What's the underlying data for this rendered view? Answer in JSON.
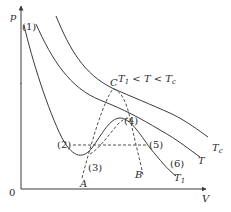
{
  "diagram": {
    "axes": {
      "y_label": "p",
      "x_label": "V",
      "origin_label": "0"
    },
    "condition": {
      "T1": "T",
      "sub1": "1",
      "lt1": " < ",
      "T": "T",
      "lt2": " < ",
      "Tc": "T",
      "subc": "c"
    },
    "curves": [
      {
        "id": "T1",
        "label": "T",
        "sub": "1",
        "style": "solid"
      },
      {
        "id": "T",
        "label": "T",
        "sub": "",
        "style": "solid"
      },
      {
        "id": "Tc",
        "label": "T",
        "sub": "c",
        "style": "solid"
      }
    ],
    "points": {
      "C": "C",
      "A": "A",
      "B": "B",
      "p1": "(1)",
      "p2": "(2)",
      "p3": "(3)",
      "p4": "(4)",
      "p5": "(5)",
      "p6": "(6)"
    },
    "colors": {
      "line": "#3a3a3a",
      "text": "#2a2a2a",
      "background": "#ffffff"
    }
  }
}
